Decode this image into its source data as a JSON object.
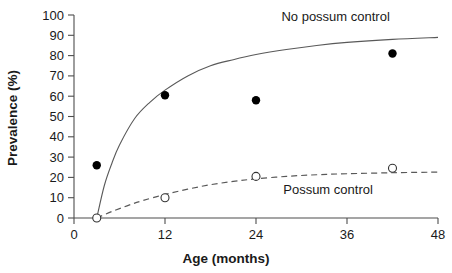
{
  "chart_data": {
    "type": "scatter",
    "title": "",
    "xlabel": "Age (months)",
    "ylabel": "Prevalence (%)",
    "xlim": [
      0,
      48
    ],
    "ylim": [
      0,
      100
    ],
    "xticks": [
      0,
      12,
      24,
      36,
      48
    ],
    "yticks": [
      0,
      10,
      20,
      30,
      40,
      50,
      60,
      70,
      80,
      90,
      100
    ],
    "xtick_labels": [
      "0",
      "12",
      "24",
      "36",
      "48"
    ],
    "ytick_labels": [
      "0",
      "10",
      "20",
      "30",
      "40",
      "50",
      "60",
      "70",
      "80",
      "90",
      "100"
    ],
    "grid": false,
    "legend_position": "inline-annotations",
    "series": [
      {
        "name": "No possum control",
        "marker": "filled-circle",
        "line_style": "solid",
        "annotation": "No possum control",
        "annotation_x": 34.5,
        "annotation_y": 97,
        "points": [
          {
            "x": 3,
            "y": 26
          },
          {
            "x": 12,
            "y": 60.5
          },
          {
            "x": 24,
            "y": 58
          },
          {
            "x": 42,
            "y": 81
          }
        ],
        "curve": [
          {
            "x": 3,
            "y": 0
          },
          {
            "x": 4,
            "y": 16
          },
          {
            "x": 5,
            "y": 27
          },
          {
            "x": 6,
            "y": 36
          },
          {
            "x": 8,
            "y": 49
          },
          {
            "x": 10,
            "y": 57
          },
          {
            "x": 12,
            "y": 63
          },
          {
            "x": 15,
            "y": 70
          },
          {
            "x": 18,
            "y": 75
          },
          {
            "x": 21,
            "y": 78
          },
          {
            "x": 24,
            "y": 80.5
          },
          {
            "x": 28,
            "y": 83
          },
          {
            "x": 32,
            "y": 85
          },
          {
            "x": 36,
            "y": 86.5
          },
          {
            "x": 42,
            "y": 88
          },
          {
            "x": 48,
            "y": 89
          }
        ]
      },
      {
        "name": "Possum control",
        "marker": "open-circle",
        "line_style": "dashed",
        "annotation": "Possum control",
        "annotation_x": 33.5,
        "annotation_y": 12,
        "points": [
          {
            "x": 3,
            "y": 0
          },
          {
            "x": 12,
            "y": 10
          },
          {
            "x": 24,
            "y": 20.5
          },
          {
            "x": 42,
            "y": 24.5
          }
        ],
        "curve": [
          {
            "x": 3,
            "y": 0
          },
          {
            "x": 5,
            "y": 3.2
          },
          {
            "x": 7,
            "y": 6.0
          },
          {
            "x": 9,
            "y": 8.5
          },
          {
            "x": 12,
            "y": 11.6
          },
          {
            "x": 15,
            "y": 14.2
          },
          {
            "x": 18,
            "y": 16.4
          },
          {
            "x": 21,
            "y": 18.0
          },
          {
            "x": 24,
            "y": 19.3
          },
          {
            "x": 28,
            "y": 20.5
          },
          {
            "x": 32,
            "y": 21.3
          },
          {
            "x": 36,
            "y": 21.8
          },
          {
            "x": 42,
            "y": 22.3
          },
          {
            "x": 48,
            "y": 22.6
          }
        ]
      }
    ]
  },
  "axes": {
    "x_title": "Age (months)",
    "y_title": "Prevalence (%)"
  }
}
